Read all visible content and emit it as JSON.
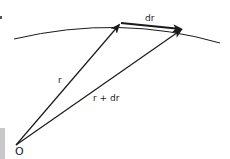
{
  "diagram": {
    "labels": {
      "r": "r",
      "r_plus_dr": "r + dr",
      "dr": "dr",
      "origin": "O"
    },
    "colors": {
      "ink": "#1a1a1a",
      "margin_bar": "#c8c8c8",
      "background": "#ffffff"
    }
  }
}
